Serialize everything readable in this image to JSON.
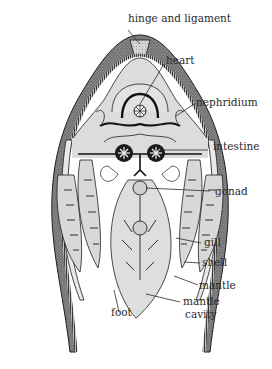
{
  "figure": {
    "colors": {
      "background": "#ffffff",
      "shell_stipple": "#6e6e6e",
      "tissue_fill": "#dcdcdc",
      "ink": "#1e1e1e",
      "label_text": "#2a2a2a"
    }
  },
  "labels": [
    {
      "id": "hinge",
      "text": "hinge and ligament"
    },
    {
      "id": "heart",
      "text": "heart"
    },
    {
      "id": "nephridium",
      "text": "nephridium"
    },
    {
      "id": "intestine",
      "text": "intestine"
    },
    {
      "id": "gonad",
      "text": "gonad"
    },
    {
      "id": "gill",
      "text": "gill"
    },
    {
      "id": "shell",
      "text": "shell"
    },
    {
      "id": "mantle",
      "text": "mantle"
    },
    {
      "id": "mantle_cavity_line1",
      "text": "mantle"
    },
    {
      "id": "mantle_cavity_line2",
      "text": "cavity"
    },
    {
      "id": "foot",
      "text": "foot"
    }
  ]
}
